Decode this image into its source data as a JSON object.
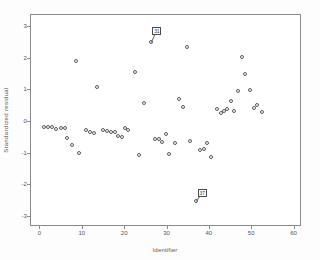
{
  "figure": {
    "background": "#ffffff",
    "frame_color": "#8a8a8a",
    "marker_color": "#595959"
  },
  "chart_data": {
    "type": "scatter",
    "title": "",
    "xlabel": "Identifier",
    "ylabel": "Standardized residual",
    "xlim": [
      -2,
      62
    ],
    "ylim": [
      -3.35,
      3.35
    ],
    "xticks": [
      0,
      10,
      20,
      30,
      40,
      50,
      60
    ],
    "yticks": [
      3,
      2,
      1,
      0,
      -1,
      -2,
      -3
    ],
    "xtick_labels": [
      "0",
      "10",
      "20",
      "30",
      "40",
      "50",
      "60"
    ],
    "ytick_labels": [
      "3",
      "2",
      "1",
      "0",
      "-1",
      "-2",
      "-3"
    ],
    "grid": false,
    "legend": false,
    "marker": "open-circle",
    "series": [
      {
        "name": "Standardized residual",
        "points": [
          [
            1.0,
            -0.19
          ],
          [
            2.0,
            -0.19
          ],
          [
            3.0,
            -0.2
          ],
          [
            4.0,
            -0.24
          ],
          [
            5.0,
            -0.22
          ],
          [
            6.0,
            -0.23
          ],
          [
            6.6,
            -0.53
          ],
          [
            7.6,
            -0.75
          ],
          [
            8.6,
            1.91
          ],
          [
            9.4,
            -1.0
          ],
          [
            11.0,
            -0.27
          ],
          [
            12.0,
            -0.34
          ],
          [
            12.8,
            -0.39
          ],
          [
            13.6,
            1.08
          ],
          [
            15.0,
            -0.28
          ],
          [
            16.0,
            -0.33
          ],
          [
            17.0,
            -0.36
          ],
          [
            17.8,
            -0.35
          ],
          [
            18.6,
            -0.47
          ],
          [
            19.4,
            -0.5
          ],
          [
            20.2,
            -0.22
          ],
          [
            21.0,
            -0.28
          ],
          [
            22.6,
            1.55
          ],
          [
            23.4,
            -1.07
          ],
          [
            24.8,
            0.57
          ],
          [
            26.4,
            2.5
          ],
          [
            27.4,
            -0.58
          ],
          [
            28.2,
            -0.56
          ],
          [
            29.0,
            -0.66
          ],
          [
            29.8,
            -0.4
          ],
          [
            30.6,
            -1.05
          ],
          [
            32.0,
            -0.68
          ],
          [
            33.0,
            0.68
          ],
          [
            34.0,
            0.44
          ],
          [
            34.8,
            2.33
          ],
          [
            35.6,
            -0.62
          ],
          [
            37.0,
            -2.53
          ],
          [
            38.0,
            -0.93
          ],
          [
            38.8,
            -0.9
          ],
          [
            39.6,
            -0.7
          ],
          [
            40.4,
            -1.14
          ],
          [
            42.0,
            0.39
          ],
          [
            42.8,
            0.26
          ],
          [
            43.6,
            0.33
          ],
          [
            44.4,
            0.38
          ],
          [
            45.2,
            0.64
          ],
          [
            46.0,
            0.32
          ],
          [
            46.8,
            0.96
          ],
          [
            47.8,
            2.02
          ],
          [
            48.6,
            1.47
          ],
          [
            49.8,
            0.98
          ],
          [
            50.6,
            0.41
          ],
          [
            51.4,
            0.51
          ],
          [
            52.6,
            0.27
          ]
        ]
      }
    ],
    "annotations": [
      {
        "label": "31",
        "x": 26.4,
        "y": 2.5,
        "box_x": 27.6,
        "box_y": 2.86
      },
      {
        "label": "37",
        "x": 37.0,
        "y": -2.53,
        "box_x": 38.3,
        "box_y": -2.28
      }
    ]
  }
}
